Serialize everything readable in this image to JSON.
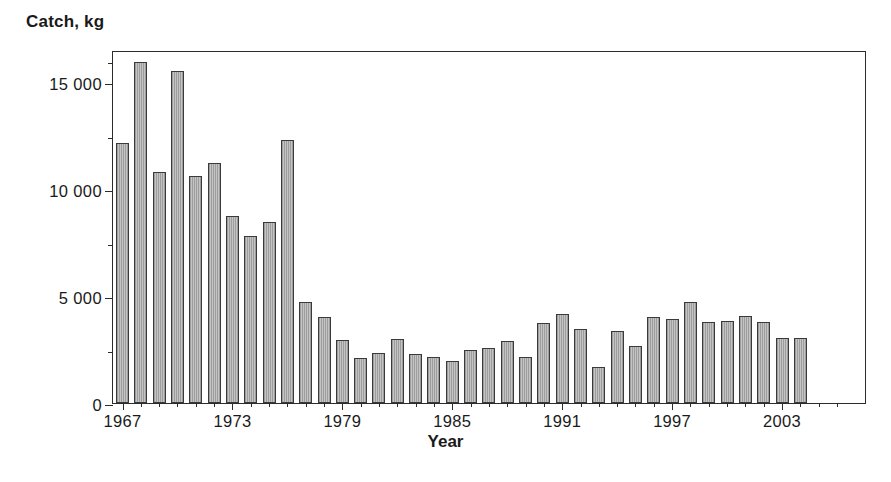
{
  "chart_data": {
    "type": "bar",
    "title": "",
    "ylabel": "Catch, kg",
    "xlabel": "Year",
    "ylim": [
      0,
      16500
    ],
    "ytick_labels": [
      "0",
      "5 000",
      "10 000",
      "15 000"
    ],
    "ytick_values": [
      0,
      5000,
      10000,
      15000
    ],
    "yminor_values": [
      2500,
      7500,
      12500,
      16000
    ],
    "xtick_labels": [
      "1967",
      "1973",
      "1979",
      "1985",
      "1991",
      "1997",
      "2003"
    ],
    "xtick_values": [
      1967,
      1973,
      1979,
      1985,
      1991,
      1997,
      2003
    ],
    "grid": false,
    "legend": "none",
    "bar_color": "#b4b4b4",
    "bar_edge_color": "#3a3a3a",
    "categories": [
      1967,
      1968,
      1969,
      1970,
      1971,
      1972,
      1973,
      1974,
      1975,
      1976,
      1977,
      1978,
      1979,
      1980,
      1981,
      1982,
      1983,
      1984,
      1985,
      1986,
      1987,
      1988,
      1989,
      1990,
      1991,
      1992,
      1993,
      1994,
      1995,
      1996,
      1997,
      1998,
      1999,
      2000,
      2001,
      2002,
      2003,
      2004,
      2005,
      2006
    ],
    "values": [
      12150,
      15950,
      10800,
      15500,
      10600,
      11200,
      8750,
      7800,
      8450,
      12300,
      4700,
      4000,
      2950,
      2100,
      2350,
      3000,
      2300,
      2150,
      1950,
      2500,
      2550,
      2900,
      2150,
      3750,
      4150,
      3450,
      1700,
      3350,
      2650,
      4000,
      3950,
      4700,
      3800,
      3850,
      4050,
      3800,
      3050,
      3050,
      0,
      0
    ]
  },
  "axes": {
    "ylabel": "Catch, kg",
    "xlabel": "Year"
  }
}
